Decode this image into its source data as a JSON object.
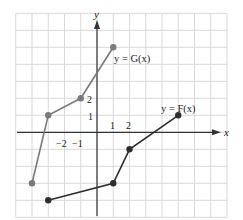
{
  "chart_data": {
    "type": "line",
    "title": "",
    "xlabel": "x",
    "ylabel": "y",
    "xlim": [
      -5,
      8
    ],
    "ylim": [
      -5,
      7
    ],
    "grid": true,
    "x_tick_labels": [
      {
        "value": -2,
        "label": "−2"
      },
      {
        "value": -1,
        "label": "−1"
      },
      {
        "value": 1,
        "label": "1"
      },
      {
        "value": 2,
        "label": "2"
      }
    ],
    "y_tick_labels": [
      {
        "value": 1,
        "label": "1"
      },
      {
        "value": 2,
        "label": "2"
      }
    ],
    "series": [
      {
        "name": "y = G(x)",
        "color": "#7a7a7a",
        "points": [
          [
            -4,
            -3
          ],
          [
            -3,
            1
          ],
          [
            -1,
            2
          ],
          [
            1,
            5
          ]
        ]
      },
      {
        "name": "y = F(x)",
        "color": "#2e2e2e",
        "points": [
          [
            -3,
            -4
          ],
          [
            1,
            -3
          ],
          [
            2,
            -1
          ],
          [
            5,
            1
          ]
        ]
      }
    ],
    "annotations": [
      {
        "text": "y = G(x)",
        "series": "G"
      },
      {
        "text": "y = F(x)",
        "series": "F"
      }
    ]
  },
  "labels": {
    "x_axis": "x",
    "y_axis": "y",
    "g_label": "y = G(x)",
    "f_label": "y = F(x)",
    "tick_x_m2": "−2",
    "tick_x_m1": "−1",
    "tick_x_1": "1",
    "tick_x_2": "2",
    "tick_y_1": "1",
    "tick_y_2": "2"
  },
  "colors": {
    "grid": "#d9d9d9",
    "axis": "#333333",
    "g_series": "#7a7a7a",
    "f_series": "#2e2e2e"
  }
}
